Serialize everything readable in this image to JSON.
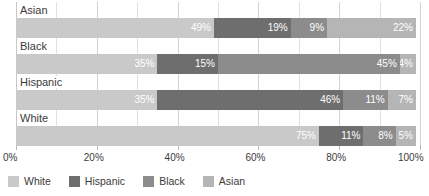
{
  "chart_data": {
    "type": "bar",
    "orientation": "horizontal",
    "stacked": true,
    "stack_mode": "percent",
    "title": "",
    "subtitle": "",
    "xlabel": "",
    "ylabel": "",
    "xlim": [
      0,
      100
    ],
    "grid": true,
    "legend_position": "bottom",
    "categories": [
      "Asian",
      "Black",
      "Hispanic",
      "White"
    ],
    "x_tick_labels": [
      "0%",
      "20%",
      "40%",
      "60%",
      "80%",
      "100%"
    ],
    "x_tick_values": [
      0,
      20,
      40,
      60,
      80,
      100
    ],
    "series": [
      {
        "name": "White",
        "color": "#c9c9c9",
        "values": [
          49,
          35,
          35,
          75
        ],
        "labels": [
          "49%",
          "35%",
          "35%",
          "75%"
        ]
      },
      {
        "name": "Hispanic",
        "color": "#6e6e6e",
        "values": [
          19,
          15,
          46,
          11
        ],
        "labels": [
          "19%",
          "15%",
          "46%",
          "11%"
        ]
      },
      {
        "name": "Black",
        "color": "#8c8c8c",
        "values": [
          9,
          45,
          11,
          8
        ],
        "labels": [
          "9%",
          "45%",
          "11%",
          "8%"
        ]
      },
      {
        "name": "Asian",
        "color": "#b5b5b5",
        "values": [
          22,
          4,
          7,
          5
        ],
        "labels": [
          "22%",
          "4%",
          "7%",
          "5%"
        ]
      }
    ],
    "rows": [
      {
        "category": "Asian",
        "segments": [
          {
            "series": "White",
            "value": 49,
            "label": "49%",
            "color": "#c9c9c9"
          },
          {
            "series": "Hispanic",
            "value": 19,
            "label": "19%",
            "color": "#6e6e6e"
          },
          {
            "series": "Black",
            "value": 9,
            "label": "9%",
            "color": "#8c8c8c"
          },
          {
            "series": "Asian",
            "value": 22,
            "label": "22%",
            "color": "#b5b5b5"
          }
        ]
      },
      {
        "category": "Black",
        "segments": [
          {
            "series": "White",
            "value": 35,
            "label": "35%",
            "color": "#c9c9c9"
          },
          {
            "series": "Hispanic",
            "value": 15,
            "label": "15%",
            "color": "#6e6e6e"
          },
          {
            "series": "Black",
            "value": 45,
            "label": "45%",
            "color": "#8c8c8c"
          },
          {
            "series": "Asian",
            "value": 4,
            "label": "4%",
            "color": "#b5b5b5"
          }
        ]
      },
      {
        "category": "Hispanic",
        "segments": [
          {
            "series": "White",
            "value": 35,
            "label": "35%",
            "color": "#c9c9c9"
          },
          {
            "series": "Hispanic",
            "value": 46,
            "label": "46%",
            "color": "#6e6e6e"
          },
          {
            "series": "Black",
            "value": 11,
            "label": "11%",
            "color": "#8c8c8c"
          },
          {
            "series": "Asian",
            "value": 7,
            "label": "7%",
            "color": "#b5b5b5"
          }
        ]
      },
      {
        "category": "White",
        "segments": [
          {
            "series": "White",
            "value": 75,
            "label": "75%",
            "color": "#c9c9c9"
          },
          {
            "series": "Hispanic",
            "value": 11,
            "label": "11%",
            "color": "#6e6e6e"
          },
          {
            "series": "Black",
            "value": 8,
            "label": "8%",
            "color": "#8c8c8c"
          },
          {
            "series": "Asian",
            "value": 5,
            "label": "5%",
            "color": "#b5b5b5"
          }
        ]
      }
    ]
  },
  "legend": {
    "items": [
      {
        "label": "White",
        "color": "#c9c9c9"
      },
      {
        "label": "Hispanic",
        "color": "#6e6e6e"
      },
      {
        "label": "Black",
        "color": "#8c8c8c"
      },
      {
        "label": "Asian",
        "color": "#b5b5b5"
      }
    ]
  },
  "colors": {
    "white_series": "#c9c9c9",
    "hispanic_series": "#6e6e6e",
    "black_series": "#8c8c8c",
    "asian_series": "#b5b5b5",
    "gridline": "#d2d2d2",
    "text": "#3b3b3b",
    "segment_label": "#ffffff",
    "background": "#ffffff"
  }
}
